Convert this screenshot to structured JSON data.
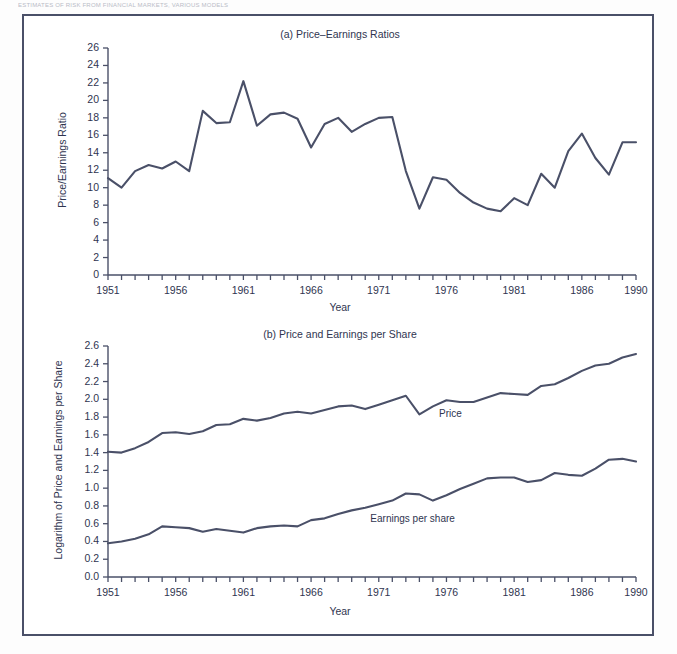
{
  "header": {
    "running_text": "ESTIMATES OF RISK FROM FINANCIAL MARKETS, VARIOUS MODELS"
  },
  "figure": {
    "xlabel": "Year",
    "line_color": "#4a5068",
    "frame_color": "#4a5068",
    "background": "#ffffff"
  },
  "chart_data": [
    {
      "type": "line",
      "panel": "a",
      "title": "(a) Price–Earnings Ratios",
      "xlabel": "Year",
      "ylabel": "Price/Earnings Ratio",
      "xlim": [
        1951,
        1990
      ],
      "ylim": [
        0,
        26
      ],
      "ytick_labels": [
        "0",
        "2",
        "4",
        "6",
        "8",
        "10",
        "12",
        "14",
        "16",
        "18",
        "20",
        "22",
        "24",
        "26"
      ],
      "yticks": [
        0,
        2,
        4,
        6,
        8,
        10,
        12,
        14,
        16,
        18,
        20,
        22,
        24,
        26
      ],
      "xtick_labels": [
        "1951",
        "1956",
        "1961",
        "1966",
        "1971",
        "1976",
        "1981",
        "1986",
        "1990"
      ],
      "xticks": [
        1951,
        1956,
        1961,
        1966,
        1971,
        1976,
        1981,
        1986,
        1990
      ],
      "minor_xticks_every": 1,
      "grid": false,
      "legend": "none",
      "series": [
        {
          "name": "Price/Earnings Ratio",
          "x": [
            1951,
            1952,
            1953,
            1954,
            1955,
            1956,
            1957,
            1958,
            1959,
            1960,
            1961,
            1962,
            1963,
            1964,
            1965,
            1966,
            1967,
            1968,
            1969,
            1970,
            1971,
            1972,
            1973,
            1974,
            1975,
            1976,
            1977,
            1978,
            1979,
            1980,
            1981,
            1982,
            1983,
            1984,
            1985,
            1986,
            1987,
            1988,
            1989,
            1990
          ],
          "values": [
            11.1,
            10.0,
            11.9,
            12.6,
            12.2,
            13.0,
            11.9,
            18.8,
            17.4,
            17.5,
            22.2,
            17.1,
            18.4,
            18.6,
            17.9,
            14.6,
            17.3,
            18.0,
            16.4,
            17.3,
            18.0,
            18.1,
            11.9,
            7.6,
            11.2,
            10.9,
            9.4,
            8.3,
            7.6,
            7.3,
            8.8,
            8.0,
            11.6,
            10.0,
            14.2,
            16.2,
            13.4,
            11.5,
            15.2,
            15.2
          ]
        }
      ]
    },
    {
      "type": "line",
      "panel": "b",
      "title": "(b) Price and Earnings per Share",
      "xlabel": "Year",
      "ylabel": "Logarithm of Price and Earnings per Share",
      "xlim": [
        1951,
        1990
      ],
      "ylim": [
        0.0,
        2.6
      ],
      "ytick_labels": [
        "0.0",
        "0.2",
        "0.4",
        "0.6",
        "0.8",
        "1.0",
        "1.2",
        "1.4",
        "1.6",
        "1.8",
        "2.0",
        "2.2",
        "2.4",
        "2.6"
      ],
      "yticks": [
        0.0,
        0.2,
        0.4,
        0.6,
        0.8,
        1.0,
        1.2,
        1.4,
        1.6,
        1.8,
        2.0,
        2.2,
        2.4,
        2.6
      ],
      "xtick_labels": [
        "1951",
        "1956",
        "1961",
        "1966",
        "1971",
        "1976",
        "1981",
        "1986",
        "1990"
      ],
      "xticks": [
        1951,
        1956,
        1961,
        1966,
        1971,
        1976,
        1981,
        1986,
        1990
      ],
      "minor_xticks_every": 1,
      "grid": false,
      "legend": "inline-annotations",
      "annotations": [
        {
          "text": "Price",
          "x": 1976.3,
          "y": 1.82
        },
        {
          "text": "Earnings per share",
          "x": 1973.5,
          "y": 0.64
        }
      ],
      "series": [
        {
          "name": "Price",
          "x": [
            1951,
            1952,
            1953,
            1954,
            1955,
            1956,
            1957,
            1958,
            1959,
            1960,
            1961,
            1962,
            1963,
            1964,
            1965,
            1966,
            1967,
            1968,
            1969,
            1970,
            1971,
            1972,
            1973,
            1974,
            1975,
            1976,
            1977,
            1978,
            1979,
            1980,
            1981,
            1982,
            1983,
            1984,
            1985,
            1986,
            1987,
            1988,
            1989,
            1990
          ],
          "values": [
            1.41,
            1.4,
            1.45,
            1.52,
            1.62,
            1.63,
            1.61,
            1.64,
            1.71,
            1.72,
            1.78,
            1.76,
            1.79,
            1.84,
            1.86,
            1.84,
            1.88,
            1.92,
            1.93,
            1.89,
            1.94,
            1.99,
            2.04,
            1.83,
            1.92,
            1.99,
            1.97,
            1.97,
            2.02,
            2.07,
            2.06,
            2.05,
            2.15,
            2.17,
            2.24,
            2.32,
            2.38,
            2.4,
            2.47,
            2.51
          ]
        },
        {
          "name": "Earnings per share",
          "x": [
            1951,
            1952,
            1953,
            1954,
            1955,
            1956,
            1957,
            1958,
            1959,
            1960,
            1961,
            1962,
            1963,
            1964,
            1965,
            1966,
            1967,
            1968,
            1969,
            1970,
            1971,
            1972,
            1973,
            1974,
            1975,
            1976,
            1977,
            1978,
            1979,
            1980,
            1981,
            1982,
            1983,
            1984,
            1985,
            1986,
            1987,
            1988,
            1989,
            1990
          ],
          "values": [
            0.38,
            0.4,
            0.43,
            0.48,
            0.57,
            0.56,
            0.55,
            0.51,
            0.54,
            0.52,
            0.5,
            0.55,
            0.57,
            0.58,
            0.57,
            0.64,
            0.66,
            0.71,
            0.75,
            0.78,
            0.82,
            0.86,
            0.94,
            0.93,
            0.86,
            0.92,
            0.99,
            1.05,
            1.11,
            1.12,
            1.12,
            1.07,
            1.09,
            1.17,
            1.15,
            1.14,
            1.22,
            1.32,
            1.33,
            1.3
          ]
        }
      ]
    }
  ]
}
